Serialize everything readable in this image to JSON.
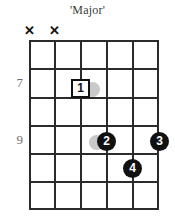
{
  "title": "'Major'",
  "colors": {
    "grid": "#2b2b2b",
    "marker_fill": "#111111",
    "marker_text": "#ffffff",
    "open_marker_fill": "#ffffff",
    "fret_number": "#6e6e6e",
    "ghost": "#c9c9c9",
    "background": "#ffffff"
  },
  "fretboard": {
    "string_count": 6,
    "fret_count": 6,
    "strings": [
      {
        "index": 1,
        "x": 0
      },
      {
        "index": 2,
        "x": 25
      },
      {
        "index": 3,
        "x": 51
      },
      {
        "index": 4,
        "x": 77
      },
      {
        "index": 5,
        "x": 103
      },
      {
        "index": 6,
        "x": 128
      }
    ],
    "frets": [
      {
        "index": 0,
        "y": 0
      },
      {
        "index": 1,
        "y": 28
      },
      {
        "index": 2,
        "y": 57
      },
      {
        "index": 3,
        "y": 85
      },
      {
        "index": 4,
        "y": 113
      },
      {
        "index": 5,
        "y": 141
      },
      {
        "index": 6,
        "y": 168
      }
    ]
  },
  "fret_numbers": [
    {
      "label": "7",
      "top": 76
    },
    {
      "label": "9",
      "top": 133
    }
  ],
  "muted_strings": [
    {
      "label": "✕",
      "name": "mute-marker-string-1",
      "left": 23,
      "top": 24
    },
    {
      "label": "✕",
      "name": "mute-marker-string-2",
      "left": 48,
      "top": 24
    }
  ],
  "finger_markers": [
    {
      "label": "1",
      "shape": "square",
      "string": 3,
      "fret": 2,
      "left": 71,
      "top": 79
    },
    {
      "label": "2",
      "shape": "circle",
      "string": 4,
      "fret": 4,
      "left": 97,
      "top": 132
    },
    {
      "label": "3",
      "shape": "circle",
      "string": 6,
      "fret": 4,
      "left": 150,
      "top": 132
    },
    {
      "label": "4",
      "shape": "circle",
      "string": 5,
      "fret": 5,
      "left": 123,
      "top": 159
    }
  ],
  "ghost_markers": [
    {
      "name": "ghost-dot-near-marker-1",
      "left": 85,
      "top": 82
    },
    {
      "name": "ghost-dot-near-marker-2",
      "left": 89,
      "top": 135
    }
  ]
}
